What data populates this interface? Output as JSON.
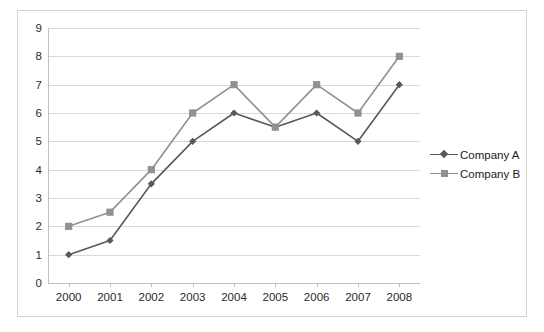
{
  "chart_data": {
    "type": "line",
    "title": "",
    "xlabel": "",
    "ylabel": "",
    "categories": [
      "2000",
      "2001",
      "2002",
      "2003",
      "2004",
      "2005",
      "2006",
      "2007",
      "2008"
    ],
    "series": [
      {
        "name": "Company A",
        "marker": "diamond",
        "color": "#595959",
        "values": [
          1,
          1.5,
          3.5,
          5,
          6,
          5.5,
          6,
          5,
          7
        ]
      },
      {
        "name": "Company B",
        "marker": "square",
        "color": "#919191",
        "values": [
          2,
          2.5,
          4,
          6,
          7,
          5.5,
          7,
          6,
          8
        ]
      }
    ],
    "ylim": [
      0,
      9
    ],
    "y_ticks": [
      "0",
      "1",
      "2",
      "3",
      "4",
      "5",
      "6",
      "7",
      "8",
      "9"
    ],
    "grid": true,
    "legend_position": "right"
  },
  "legend": {
    "entries": [
      {
        "label": "Company A"
      },
      {
        "label": "Company B"
      }
    ]
  },
  "colors": {
    "series_a": "#595959",
    "series_b": "#919191",
    "gridline": "#d9d9d9",
    "axis": "#bfbfbf",
    "frame": "#d4d4d4",
    "text": "#2b2b2b",
    "background": "#ffffff"
  }
}
